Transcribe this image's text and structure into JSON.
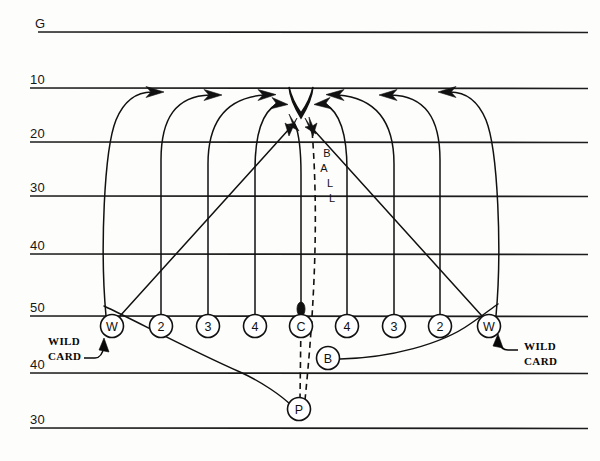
{
  "diagram": {
    "type": "football-play-diagram",
    "colors": {
      "ink": "#111111",
      "paper": "#fdfdfc",
      "yardline": "#1c1c1c"
    },
    "yard_lines": [
      {
        "label": "G",
        "y": 32
      },
      {
        "label": "10",
        "y": 88
      },
      {
        "label": "20",
        "y": 142
      },
      {
        "label": "30",
        "y": 196
      },
      {
        "label": "40",
        "y": 254
      },
      {
        "label": "50",
        "y": 316
      },
      {
        "label": "40",
        "y": 373
      },
      {
        "label": "30",
        "y": 428
      }
    ],
    "line_of_scrimmage_label": "50",
    "players": [
      {
        "id": "wild-left",
        "label": "W",
        "cx": 112,
        "cy": 326,
        "role": "wild card gunner left"
      },
      {
        "id": "two-left",
        "label": "2",
        "cx": 161,
        "cy": 326,
        "role": "coverage lane 2 left"
      },
      {
        "id": "three-left",
        "label": "3",
        "cx": 208,
        "cy": 326,
        "role": "coverage lane 3 left"
      },
      {
        "id": "four-left",
        "label": "4",
        "cx": 255,
        "cy": 326,
        "role": "coverage lane 4 left"
      },
      {
        "id": "center",
        "label": "C",
        "cx": 301,
        "cy": 326,
        "role": "center / long snapper"
      },
      {
        "id": "four-right",
        "label": "4",
        "cx": 347,
        "cy": 326,
        "role": "coverage lane 4 right"
      },
      {
        "id": "three-right",
        "label": "3",
        "cx": 394,
        "cy": 326,
        "role": "coverage lane 3 right"
      },
      {
        "id": "two-right",
        "label": "2",
        "cx": 440,
        "cy": 326,
        "role": "coverage lane 2 right"
      },
      {
        "id": "wild-right",
        "label": "W",
        "cx": 489,
        "cy": 326,
        "role": "wild card gunner right"
      },
      {
        "id": "blocker",
        "label": "B",
        "cx": 328,
        "cy": 358,
        "role": "personal protector"
      },
      {
        "id": "punter",
        "label": "P",
        "cx": 299,
        "cy": 409,
        "role": "punter"
      }
    ],
    "annotations": {
      "wild_card_left": {
        "line1": "WILD",
        "line2": "CARD",
        "x": 48,
        "y": 341
      },
      "wild_card_right": {
        "line1": "WILD",
        "line2": "CARD",
        "x": 524,
        "y": 346
      },
      "ball_label": {
        "letters": [
          "B",
          "A",
          "L",
          "L"
        ],
        "x": 327,
        "y_start": 152,
        "y_step": 15
      }
    },
    "returner": {
      "id": "return-man",
      "x": 301,
      "cy": 103,
      "label": ""
    },
    "ball_marker": {
      "x": 301,
      "y": 310
    }
  }
}
